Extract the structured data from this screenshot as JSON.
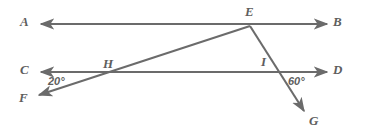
{
  "diagram": {
    "background_color": "#ffffff",
    "stroke_color": "#6b6b6b",
    "label_color": "#5e5e5e",
    "stroke_width": 2.1,
    "point_labels": [
      {
        "name": "A",
        "text": "A",
        "x": 20,
        "y": 15
      },
      {
        "name": "B",
        "text": "B",
        "x": 333,
        "y": 15
      },
      {
        "name": "C",
        "text": "C",
        "x": 20,
        "y": 63
      },
      {
        "name": "D",
        "text": "D",
        "x": 333,
        "y": 63
      },
      {
        "name": "E",
        "text": "E",
        "x": 245,
        "y": 5
      },
      {
        "name": "F",
        "text": "F",
        "x": 19,
        "y": 91
      },
      {
        "name": "G",
        "text": "G",
        "x": 309,
        "y": 114
      },
      {
        "name": "H",
        "text": "H",
        "x": 103,
        "y": 57
      },
      {
        "name": "I",
        "text": "I",
        "x": 261,
        "y": 55
      }
    ],
    "angle_labels": [
      {
        "name": "angle-20",
        "text": "20°",
        "value": 20,
        "x": 48,
        "y": 76
      },
      {
        "name": "angle-60",
        "text": "60°",
        "value": 60,
        "x": 288,
        "y": 76
      }
    ],
    "lines": [
      {
        "name": "line-AB",
        "from": "A",
        "to": "B",
        "x1": 41,
        "y1": 24,
        "x2": 327,
        "y2": 24,
        "arrow_start": true,
        "arrow_end": true
      },
      {
        "name": "line-CD",
        "from": "C",
        "to": "D",
        "x1": 41,
        "y1": 72,
        "x2": 327,
        "y2": 72,
        "arrow_start": true,
        "arrow_end": true
      },
      {
        "name": "ray-EF",
        "from": "E",
        "to": "F",
        "x1": 250,
        "y1": 26,
        "x2": 39,
        "y2": 95,
        "arrow_start": false,
        "arrow_end": true
      },
      {
        "name": "ray-EG",
        "from": "E",
        "to": "G",
        "x1": 250,
        "y1": 26,
        "x2": 304,
        "y2": 111,
        "arrow_start": false,
        "arrow_end": true
      }
    ],
    "intersections": [
      {
        "name": "point-H",
        "label": "H",
        "x": 112,
        "y": 72
      },
      {
        "name": "point-I",
        "label": "I",
        "x": 270,
        "y": 72
      },
      {
        "name": "point-E",
        "label": "E",
        "x": 250,
        "y": 26
      }
    ]
  }
}
